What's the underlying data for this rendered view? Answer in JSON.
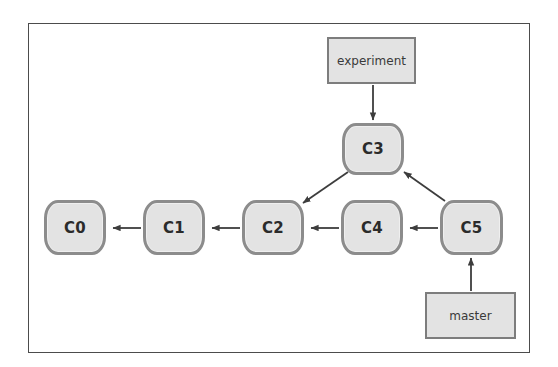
{
  "figure": {
    "background_color": "#ffffff",
    "frame_border_color": "#4c4c4c",
    "node_fill_color": "#e3e3e3",
    "node_border_color": "#8c8c8c",
    "branch_border_color": "#7d7d7d",
    "edge_color": "#3d3d3d"
  },
  "commits": [
    {
      "id": "c0",
      "label": "C0",
      "x": 44,
      "y": 200,
      "w": 62,
      "h": 55
    },
    {
      "id": "c1",
      "label": "C1",
      "x": 143,
      "y": 200,
      "w": 62,
      "h": 55
    },
    {
      "id": "c2",
      "label": "C2",
      "x": 242,
      "y": 200,
      "w": 62,
      "h": 55
    },
    {
      "id": "c3",
      "label": "C3",
      "x": 342,
      "y": 123,
      "w": 62,
      "h": 52
    },
    {
      "id": "c4",
      "label": "C4",
      "x": 341,
      "y": 200,
      "w": 62,
      "h": 55
    },
    {
      "id": "c5",
      "label": "C5",
      "x": 440,
      "y": 200,
      "w": 63,
      "h": 55
    }
  ],
  "branches": [
    {
      "id": "experiment",
      "label": "experiment",
      "x": 327,
      "y": 37,
      "w": 89,
      "h": 47
    },
    {
      "id": "master",
      "label": "master",
      "x": 425,
      "y": 292,
      "w": 91,
      "h": 47
    }
  ],
  "edges": [
    {
      "id": "c1-to-c0",
      "from": "C1",
      "to": "C0",
      "kind": "parent-link"
    },
    {
      "id": "c2-to-c1",
      "from": "C2",
      "to": "C1",
      "kind": "parent-link"
    },
    {
      "id": "c4-to-c2",
      "from": "C4",
      "to": "C2",
      "kind": "parent-link"
    },
    {
      "id": "c5-to-c4",
      "from": "C5",
      "to": "C4",
      "kind": "parent-link"
    },
    {
      "id": "c3-to-c2",
      "from": "C3",
      "to": "C2",
      "kind": "parent-link"
    },
    {
      "id": "c5-to-c3",
      "from": "C5",
      "to": "C3",
      "kind": "merge-link"
    },
    {
      "id": "experiment-to-c3",
      "from": "experiment",
      "to": "C3",
      "kind": "branch-pointer"
    },
    {
      "id": "master-to-c5",
      "from": "master",
      "to": "C5",
      "kind": "branch-pointer"
    }
  ]
}
